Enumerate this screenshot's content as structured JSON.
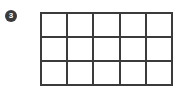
{
  "figure": {
    "name": "rectangle-partitioned-into-equal-squares",
    "background_color": "#ffffff"
  },
  "step_badge": {
    "icon_name": "filled-circle-number-badge",
    "number": "3",
    "fill_color": "#3b3b3b",
    "text_color": "#ffffff"
  },
  "grid": {
    "columns": 5,
    "rows": 3,
    "total_cells": 15,
    "line_color": "#3b3b3b",
    "cell_color": "#ffffff",
    "cells": [
      {
        "row": 1,
        "column": 1,
        "label": ""
      },
      {
        "row": 1,
        "column": 2,
        "label": ""
      },
      {
        "row": 1,
        "column": 3,
        "label": ""
      },
      {
        "row": 1,
        "column": 4,
        "label": ""
      },
      {
        "row": 1,
        "column": 5,
        "label": ""
      },
      {
        "row": 2,
        "column": 1,
        "label": ""
      },
      {
        "row": 2,
        "column": 2,
        "label": ""
      },
      {
        "row": 2,
        "column": 3,
        "label": ""
      },
      {
        "row": 2,
        "column": 4,
        "label": ""
      },
      {
        "row": 2,
        "column": 5,
        "label": ""
      },
      {
        "row": 3,
        "column": 1,
        "label": ""
      },
      {
        "row": 3,
        "column": 2,
        "label": ""
      },
      {
        "row": 3,
        "column": 3,
        "label": ""
      },
      {
        "row": 3,
        "column": 4,
        "label": ""
      },
      {
        "row": 3,
        "column": 5,
        "label": ""
      }
    ]
  }
}
